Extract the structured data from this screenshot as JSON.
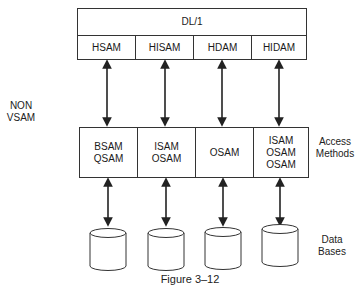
{
  "diagram": {
    "top_layer": {
      "title": "DL/1",
      "methods": [
        "HSAM",
        "HISAM",
        "HDAM",
        "HIDAM"
      ]
    },
    "side_label": "NON\nVSAM",
    "access_methods": {
      "label": "Access\nMethods",
      "columns": [
        "BSAM\nQSAM",
        "ISAM\nOSAM",
        "OSAM",
        "ISAM\nOSAM\nOSAM"
      ]
    },
    "databases": {
      "label": "Data\nBases",
      "count": 4
    },
    "caption": "Figure 3–12"
  }
}
